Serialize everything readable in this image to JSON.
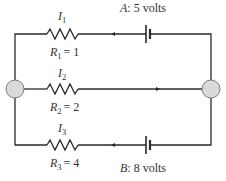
{
  "diagram": {
    "type": "electrical-circuit",
    "branches": [
      {
        "id": "top",
        "current": {
          "symbol": "I",
          "index": "1"
        },
        "resistor": {
          "symbol": "R",
          "index": "1",
          "eq": "= 1"
        },
        "battery": {
          "label_name": "A",
          "label_value": ": 5 volts"
        },
        "current_direction": "left"
      },
      {
        "id": "middle",
        "current": {
          "symbol": "I",
          "index": "2"
        },
        "resistor": {
          "symbol": "R",
          "index": "2",
          "eq": "= 2"
        },
        "current_direction": "right"
      },
      {
        "id": "bottom",
        "current": {
          "symbol": "I",
          "index": "3"
        },
        "resistor": {
          "symbol": "R",
          "index": "3",
          "eq": "= 4"
        },
        "battery": {
          "label_name": "B",
          "label_value": ": 8 volts"
        },
        "current_direction": "left"
      }
    ],
    "nodes": [
      "left-junction",
      "right-junction"
    ],
    "colors": {
      "wire": "#2a2a2a",
      "node_fill": "#d9d9d9",
      "node_stroke": "#7a7a7a",
      "text": "#333333"
    }
  }
}
